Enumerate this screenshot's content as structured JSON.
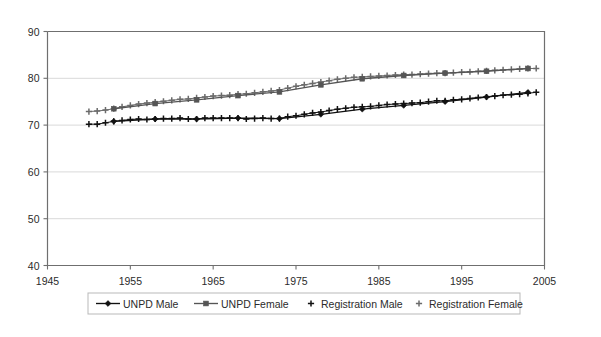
{
  "chart_data": {
    "type": "line",
    "title": "",
    "subtitle": "",
    "xlabel": "",
    "ylabel": "",
    "xlim": [
      1945,
      2005
    ],
    "ylim": [
      40,
      90
    ],
    "xticks": [
      1945,
      1955,
      1965,
      1975,
      1985,
      1995,
      2005
    ],
    "yticks": [
      40,
      50,
      60,
      70,
      80,
      90
    ],
    "grid": "horizontal",
    "legend_position": "bottom",
    "series": [
      {
        "name": "UNPD Male",
        "marker": "diamond",
        "color": "#111111",
        "x": [
          1953,
          1958,
          1963,
          1968,
          1973,
          1978,
          1983,
          1988,
          1993,
          1998,
          2003
        ],
        "values": [
          70.8,
          71.3,
          71.3,
          71.5,
          71.4,
          72.3,
          73.4,
          74.2,
          75.0,
          76.0,
          77.0
        ]
      },
      {
        "name": "UNPD Female",
        "marker": "square",
        "color": "#555555",
        "x": [
          1953,
          1958,
          1963,
          1968,
          1973,
          1978,
          1983,
          1988,
          1993,
          1998,
          2003
        ],
        "values": [
          73.5,
          74.6,
          75.4,
          76.3,
          77.1,
          78.6,
          79.9,
          80.6,
          81.1,
          81.5,
          82.1
        ]
      },
      {
        "name": "Registration Male",
        "marker": "plus",
        "color": "#111111",
        "x": [
          1950,
          1951,
          1952,
          1953,
          1954,
          1955,
          1956,
          1957,
          1958,
          1959,
          1960,
          1961,
          1962,
          1963,
          1964,
          1965,
          1966,
          1967,
          1968,
          1969,
          1970,
          1971,
          1972,
          1973,
          1974,
          1975,
          1976,
          1977,
          1978,
          1979,
          1980,
          1981,
          1982,
          1983,
          1984,
          1985,
          1986,
          1987,
          1988,
          1989,
          1990,
          1991,
          1992,
          1993,
          1994,
          1995,
          1996,
          1997,
          1998,
          1999,
          2000,
          2001,
          2002,
          2003,
          2004
        ],
        "values": [
          70.2,
          70.2,
          70.5,
          70.8,
          71.0,
          71.2,
          71.3,
          71.2,
          71.3,
          71.4,
          71.4,
          71.5,
          71.3,
          71.3,
          71.5,
          71.5,
          71.5,
          71.5,
          71.5,
          71.3,
          71.4,
          71.5,
          71.4,
          71.4,
          71.8,
          72.0,
          72.3,
          72.6,
          72.8,
          73.1,
          73.4,
          73.6,
          73.8,
          73.9,
          74.0,
          74.2,
          74.4,
          74.5,
          74.6,
          74.7,
          74.8,
          75.0,
          75.2,
          75.2,
          75.4,
          75.5,
          75.7,
          75.9,
          76.0,
          76.2,
          76.4,
          76.5,
          76.6,
          76.8,
          77.0
        ]
      },
      {
        "name": "Registration Female",
        "marker": "plus",
        "color": "#6b6b6b",
        "x": [
          1950,
          1951,
          1952,
          1953,
          1954,
          1955,
          1956,
          1957,
          1958,
          1959,
          1960,
          1961,
          1962,
          1963,
          1964,
          1965,
          1966,
          1967,
          1968,
          1969,
          1970,
          1971,
          1972,
          1973,
          1974,
          1975,
          1976,
          1977,
          1978,
          1979,
          1980,
          1981,
          1982,
          1983,
          1984,
          1985,
          1986,
          1987,
          1988,
          1989,
          1990,
          1991,
          1992,
          1993,
          1994,
          1995,
          1996,
          1997,
          1998,
          1999,
          2000,
          2001,
          2002,
          2003,
          2004
        ],
        "values": [
          72.9,
          73.0,
          73.2,
          73.5,
          73.9,
          74.2,
          74.5,
          74.7,
          74.9,
          75.1,
          75.3,
          75.5,
          75.6,
          75.8,
          76.0,
          76.2,
          76.3,
          76.4,
          76.6,
          76.7,
          76.9,
          77.1,
          77.3,
          77.5,
          77.9,
          78.3,
          78.6,
          78.9,
          79.2,
          79.5,
          79.8,
          80.0,
          80.2,
          80.3,
          80.4,
          80.5,
          80.6,
          80.7,
          80.8,
          80.8,
          80.9,
          81.0,
          81.1,
          81.1,
          81.2,
          81.3,
          81.4,
          81.5,
          81.6,
          81.7,
          81.8,
          81.9,
          82.0,
          82.1,
          82.1
        ]
      }
    ]
  },
  "legend": {
    "items": [
      {
        "label": "UNPD Male",
        "marker": "diamond-line"
      },
      {
        "label": "UNPD Female",
        "marker": "square-line"
      },
      {
        "label": "Registration Male",
        "marker": "plus"
      },
      {
        "label": "Registration Female",
        "marker": "plus"
      }
    ]
  },
  "colors": {
    "unpd_male": "#111111",
    "unpd_female": "#555555",
    "registration_male": "#111111",
    "registration_female": "#6b6b6b",
    "gridline": "#d9d9d9",
    "axis": "#6f6f6f",
    "background": "#ffffff"
  }
}
